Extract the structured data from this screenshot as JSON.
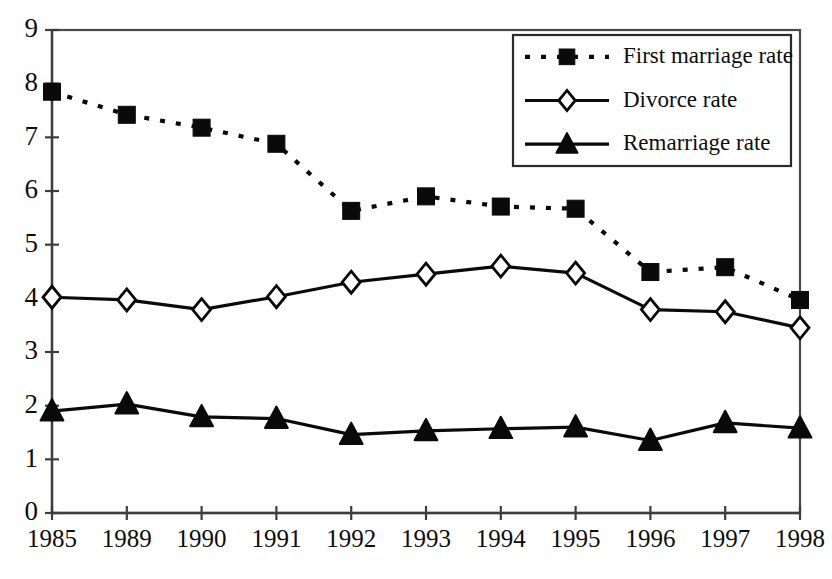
{
  "chart_data": {
    "type": "line",
    "title": "",
    "subtitle": "",
    "xlabel": "",
    "ylabel": "",
    "categories": [
      "1985",
      "1989",
      "1990",
      "1991",
      "1992",
      "1993",
      "1994",
      "1995",
      "1996",
      "1997",
      "1998"
    ],
    "ylim": [
      0,
      9
    ],
    "ytick_labels": [
      "0",
      "1",
      "2",
      "3",
      "4",
      "5",
      "6",
      "7",
      "8",
      "9"
    ],
    "ytick_values": [
      0,
      1,
      2,
      3,
      4,
      5,
      6,
      7,
      8,
      9
    ],
    "grid": false,
    "legend_position": "upper-right",
    "series": [
      {
        "name": "First marriage rate",
        "marker": "filled-square",
        "line_style": "dotted",
        "color": "#0a0a0a",
        "values": [
          7.85,
          7.42,
          7.18,
          6.88,
          5.63,
          5.9,
          5.71,
          5.67,
          4.49,
          4.58,
          3.97
        ]
      },
      {
        "name": "Divorce rate",
        "marker": "open-diamond",
        "line_style": "solid",
        "color": "#0a0a0a",
        "values": [
          4.02,
          3.97,
          3.79,
          4.03,
          4.3,
          4.45,
          4.6,
          4.47,
          3.79,
          3.75,
          3.45
        ]
      },
      {
        "name": "Remarriage rate",
        "marker": "filled-triangle",
        "line_style": "solid",
        "color": "#0a0a0a",
        "values": [
          1.9,
          2.03,
          1.79,
          1.76,
          1.46,
          1.53,
          1.57,
          1.6,
          1.35,
          1.68,
          1.58
        ]
      }
    ],
    "legend_entries": [
      {
        "label": "First marriage rate",
        "marker": "filled-square",
        "line_style": "dotted"
      },
      {
        "label": "Divorce rate",
        "marker": "open-diamond",
        "line_style": "solid"
      },
      {
        "label": "Remarriage rate",
        "marker": "filled-triangle",
        "line_style": "solid"
      }
    ]
  },
  "colors": {
    "background": "#ffffff",
    "ink": "#0a0a0a",
    "axis": "#3d3d3d",
    "frame": "#4a4a4a"
  }
}
